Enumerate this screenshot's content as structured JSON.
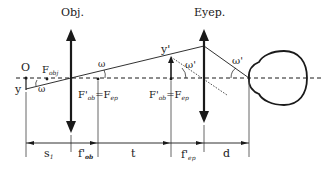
{
  "diagram": {
    "colors": {
      "ink": "#1a1a1a",
      "background": "#ffffff"
    },
    "elements": {
      "objective": {
        "label": "Obj."
      },
      "eyepiece": {
        "label": "Eyep."
      },
      "object_point": {
        "label": "O"
      },
      "object_height": {
        "label": "y"
      },
      "image_height": {
        "label": "y'"
      },
      "focal_point_objective": {
        "label": "F",
        "sub": "obj"
      },
      "common_focus_left": {
        "label": "F'",
        "sub1": "ob",
        "eq": "=F",
        "sub2": "ep"
      },
      "common_focus_right": {
        "label": "F'",
        "sub1": "ob",
        "eq": "=F",
        "sub2": "ep"
      },
      "angle_omega_left": {
        "label": "ω"
      },
      "angle_omega_mid": {
        "label": "ω"
      },
      "angle_omega_prime_image": {
        "label": "ω'"
      },
      "angle_omega_prime_eye": {
        "label": "ω'"
      }
    },
    "dimensions": [
      {
        "label": "s",
        "sub": "1"
      },
      {
        "label": "f'",
        "sub": "ob"
      },
      {
        "label": "t",
        "sub": ""
      },
      {
        "label": "f'",
        "sub": "ep"
      },
      {
        "label": "d",
        "sub": ""
      }
    ]
  }
}
